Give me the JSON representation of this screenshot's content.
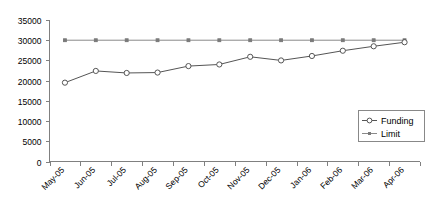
{
  "chart_data": {
    "type": "line",
    "title": "",
    "subtitle": "",
    "xlabel": "",
    "ylabel": "",
    "categories": [
      "May-05",
      "Jun-05",
      "Jul-05",
      "Aug-05",
      "Sep-05",
      "Oct-05",
      "Nov-05",
      "Dec-05",
      "Jan-06",
      "Feb-06",
      "Mar-06",
      "Apr-06"
    ],
    "series": [
      {
        "name": "Funding",
        "marker": "open-circle",
        "color": "#555555",
        "values": [
          19500,
          22400,
          21900,
          22000,
          23600,
          24000,
          25900,
          25000,
          26100,
          27400,
          28500,
          29500
        ]
      },
      {
        "name": "Limit",
        "marker": "small-dot",
        "color": "#8a8a8a",
        "values": [
          30000,
          30000,
          30000,
          30000,
          30000,
          30000,
          30000,
          30000,
          30000,
          30000,
          30000,
          30000
        ]
      }
    ],
    "ylim": [
      0,
      35000
    ],
    "yticks": [
      0,
      5000,
      10000,
      15000,
      20000,
      25000,
      30000,
      35000
    ],
    "ytick_labels": [
      "0",
      "5000",
      "10000",
      "15000",
      "20000",
      "25000",
      "30000",
      "35000"
    ],
    "grid": false,
    "legend_position": "inside-right",
    "xtick_rotation": -45
  },
  "legend": {
    "entries": [
      {
        "label": "Funding"
      },
      {
        "label": "Limit"
      }
    ]
  },
  "axes": {
    "y_axis_name": "y-axis",
    "x_axis_name": "x-axis"
  }
}
